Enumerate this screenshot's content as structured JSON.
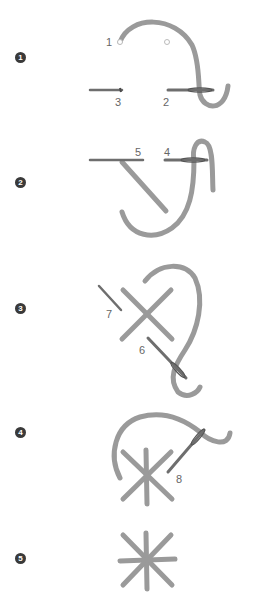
{
  "diagram": {
    "colors": {
      "yarn": "#9a9a9a",
      "needle": "#6e6e6e",
      "badge": "#3a3a3a",
      "label": "#666666",
      "background": "#ffffff"
    },
    "steps": [
      {
        "number": "1",
        "labels": [
          "1",
          "2",
          "3"
        ]
      },
      {
        "number": "2",
        "labels": [
          "4",
          "5"
        ]
      },
      {
        "number": "3",
        "labels": [
          "6",
          "7"
        ]
      },
      {
        "number": "4",
        "labels": [
          "8"
        ]
      },
      {
        "number": "5",
        "labels": []
      }
    ]
  }
}
